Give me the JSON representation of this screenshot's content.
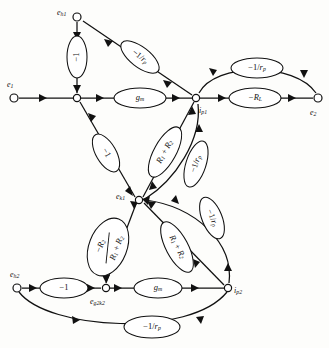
{
  "diagram": {
    "type": "signal-flow-graph",
    "title": "",
    "nodes": [
      {
        "id": "eh1",
        "label": "e",
        "sub": "h1",
        "x": 77,
        "y": 17,
        "label_x": 57,
        "label_y": 13
      },
      {
        "id": "e1",
        "label": "e",
        "sub": "1",
        "x": 14,
        "y": 98,
        "label_x": 9,
        "label_y": 86
      },
      {
        "id": "j1",
        "label": "",
        "sub": "",
        "x": 77,
        "y": 98,
        "label_x": 0,
        "label_y": 0
      },
      {
        "id": "ip1",
        "label": "i",
        "sub": "p1",
        "x": 196,
        "y": 98,
        "label_x": 198,
        "label_y": 110
      },
      {
        "id": "e2",
        "label": "e",
        "sub": "2",
        "x": 318,
        "y": 98,
        "label_x": 311,
        "label_y": 111
      },
      {
        "id": "ek1",
        "label": "e",
        "sub": "k1",
        "x": 139,
        "y": 200,
        "label_x": 118,
        "label_y": 198
      },
      {
        "id": "eh2",
        "label": "e",
        "sub": "h2",
        "x": 17,
        "y": 288,
        "label_x": 13,
        "label_y": 275
      },
      {
        "id": "eg2k2",
        "label": "e",
        "sub": "g2k2",
        "x": 106,
        "y": 288,
        "label_x": 92,
        "label_y": 300
      },
      {
        "id": "ip2",
        "label": "i",
        "sub": "p2",
        "x": 228,
        "y": 288,
        "label_x": 233,
        "label_y": 290
      }
    ],
    "edges": [
      {
        "id": "eh1-j1",
        "from": "eh1",
        "to": "j1",
        "gain": "-1",
        "gain_kind": "simple",
        "rotate": -90,
        "lx": 77,
        "ly": 57
      },
      {
        "id": "eh1-ip1",
        "from": "eh1",
        "to": "ip1",
        "gain": "-1/r",
        "gain_kind": "rp",
        "rotate": 38,
        "lx": 140,
        "ly": 57
      },
      {
        "id": "e1-j1",
        "from": "e1",
        "to": "j1",
        "gain": "",
        "gain_kind": "none",
        "rotate": 0,
        "lx": 0,
        "ly": 0
      },
      {
        "id": "j1-ip1",
        "from": "j1",
        "to": "ip1",
        "gain": "g_m",
        "gain_kind": "gm",
        "rotate": 0,
        "lx": 140,
        "ly": 98
      },
      {
        "id": "ip1-e2-arc",
        "from": "ip1",
        "to": "e2",
        "gain": "-1/r",
        "gain_kind": "rp",
        "rotate": 0,
        "lx": 257,
        "ly": 68
      },
      {
        "id": "ip1-e2",
        "from": "ip1",
        "to": "e2",
        "gain": "-R_L",
        "gain_kind": "RL",
        "rotate": 0,
        "lx": 255,
        "ly": 98
      },
      {
        "id": "j1-ek1",
        "from": "j1",
        "to": "ek1",
        "gain": "-1",
        "gain_kind": "simple",
        "rotate": 55,
        "lx": 106,
        "ly": 153
      },
      {
        "id": "ek1-ip1",
        "from": "ek1",
        "to": "ip1",
        "gain": "R1+R2",
        "gain_kind": "sumR",
        "rotate": -61,
        "lx": 163,
        "ly": 154
      },
      {
        "id": "ip1-ek1",
        "from": "ip1",
        "to": "ek1",
        "gain": "-1/r",
        "gain_kind": "rp",
        "rotate": -72,
        "lx": 196,
        "ly": 165
      },
      {
        "id": "ek1-eg2k2",
        "from": "ek1",
        "to": "eg2k2",
        "gain": "-R2/(R1+R2)",
        "gain_kind": "frac",
        "rotate": -70,
        "lx": 108,
        "ly": 248
      },
      {
        "id": "ek1-ip2",
        "from": "ek1",
        "to": "ip2",
        "gain": "R1+R2",
        "gain_kind": "sumR",
        "rotate": 62,
        "lx": 177,
        "ly": 248
      },
      {
        "id": "ip2-ek1",
        "from": "ip2",
        "to": "ek1",
        "gain": "-1/r",
        "gain_kind": "rp",
        "rotate": 68,
        "lx": 213,
        "ly": 219
      },
      {
        "id": "eh2-eg2k2",
        "from": "eh2",
        "to": "eg2k2",
        "gain": "-1",
        "gain_kind": "simple",
        "rotate": 0,
        "lx": 64,
        "ly": 288
      },
      {
        "id": "eg2k2-ip2",
        "from": "eg2k2",
        "to": "ip2",
        "gain": "g_m",
        "gain_kind": "gm",
        "rotate": 0,
        "lx": 160,
        "ly": 288
      },
      {
        "id": "eh2-ip2",
        "from": "eh2",
        "to": "ip2",
        "gain": "-1/r",
        "gain_kind": "rp",
        "rotate": 0,
        "lx": 152,
        "ly": 328
      }
    ],
    "gain_labels": {
      "minus_one": "−1",
      "minus_one_over_rp_num": "−1/",
      "rp_var": "r",
      "rp_sub": "p",
      "gm_var": "g",
      "gm_sub": "m",
      "minus_RL_var": "−R",
      "RL_sub": "L",
      "R1": "R",
      "R1_sub": "1",
      "plus": "+",
      "R2": "R",
      "R2_sub": "2",
      "frac_num_minus": "−R",
      "frac_num_sub": "2",
      "frac_den_R1": "R",
      "frac_den_R1_sub": "1",
      "frac_den_plus": "+",
      "frac_den_R2": "R",
      "frac_den_R2_sub": "2"
    }
  }
}
